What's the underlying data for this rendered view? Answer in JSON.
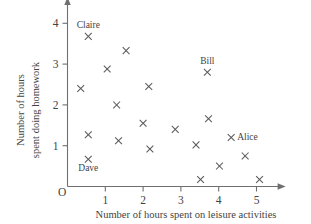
{
  "chart_data": {
    "type": "scatter",
    "title": "",
    "xlabel": "Number of hours spent on leisure activities",
    "ylabel_line1": "Number of hours",
    "ylabel_line2": "spent doing homework",
    "ylabel": "Number of hours spent doing homework",
    "origin_label": "O",
    "xlim": [
      0,
      5.4
    ],
    "ylim": [
      0,
      4.3
    ],
    "xticks": [
      1,
      2,
      3,
      4,
      5
    ],
    "yticks": [
      1,
      2,
      3,
      4
    ],
    "xtick_labels": [
      "1",
      "2",
      "3",
      "4",
      "5"
    ],
    "ytick_labels": [
      "1",
      "2",
      "3",
      "4"
    ],
    "grid": false,
    "legend": "none",
    "marker": "x",
    "points": [
      {
        "x": 0.35,
        "y": 2.4,
        "label": ""
      },
      {
        "x": 0.55,
        "y": 3.68,
        "label": "Claire",
        "label_pos": "above"
      },
      {
        "x": 0.55,
        "y": 1.27,
        "label": ""
      },
      {
        "x": 0.55,
        "y": 0.67,
        "label": "Dave",
        "label_pos": "below"
      },
      {
        "x": 1.05,
        "y": 2.88,
        "label": ""
      },
      {
        "x": 1.3,
        "y": 2.0,
        "label": ""
      },
      {
        "x": 1.35,
        "y": 1.12,
        "label": ""
      },
      {
        "x": 1.55,
        "y": 3.33,
        "label": ""
      },
      {
        "x": 2.0,
        "y": 1.55,
        "label": ""
      },
      {
        "x": 2.15,
        "y": 2.45,
        "label": ""
      },
      {
        "x": 2.18,
        "y": 0.92,
        "label": ""
      },
      {
        "x": 2.85,
        "y": 1.4,
        "label": ""
      },
      {
        "x": 3.4,
        "y": 1.02,
        "label": ""
      },
      {
        "x": 3.52,
        "y": 0.17,
        "label": ""
      },
      {
        "x": 3.7,
        "y": 2.8,
        "label": "Bill",
        "label_pos": "above"
      },
      {
        "x": 3.73,
        "y": 1.66,
        "label": ""
      },
      {
        "x": 4.02,
        "y": 0.5,
        "label": ""
      },
      {
        "x": 4.33,
        "y": 1.2,
        "label": "Alice",
        "label_pos": "right"
      },
      {
        "x": 4.7,
        "y": 0.75,
        "label": ""
      },
      {
        "x": 5.08,
        "y": 0.17,
        "label": ""
      }
    ],
    "labels": [
      {
        "name": "Claire",
        "point": {
          "x": 0.55,
          "y": 3.68
        }
      },
      {
        "name": "Dave",
        "point": {
          "x": 0.55,
          "y": 0.67
        }
      },
      {
        "name": "Bill",
        "point": {
          "x": 3.7,
          "y": 2.8
        }
      },
      {
        "name": "Alice",
        "point": {
          "x": 4.33,
          "y": 1.2
        }
      }
    ],
    "colors": {
      "marker": "#5a5a5a",
      "axis": "#6f6f6f",
      "text": "#434343",
      "background": "#ffffff"
    }
  }
}
